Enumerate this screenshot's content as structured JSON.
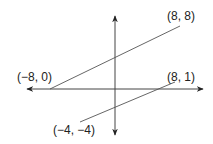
{
  "diagram": {
    "type": "coordinate-plane-lines",
    "axes": {
      "horizontal": {
        "arrows": "both"
      },
      "vertical": {
        "arrows": "both"
      }
    },
    "lines": [
      {
        "name": "upper-line",
        "start": {
          "label": "(−8, 0)",
          "x": -8,
          "y": 0
        },
        "end": {
          "label": "(8, 8)",
          "x": 8,
          "y": 8
        }
      },
      {
        "name": "lower-line",
        "start": {
          "label": "(−4, −4)",
          "x": -4,
          "y": -4
        },
        "end": {
          "label": "(8, 1)",
          "x": 8,
          "y": 1
        }
      }
    ],
    "colors": {
      "line": "#555555",
      "axis": "#444444",
      "text": "#222222",
      "background": "#ffffff"
    }
  }
}
